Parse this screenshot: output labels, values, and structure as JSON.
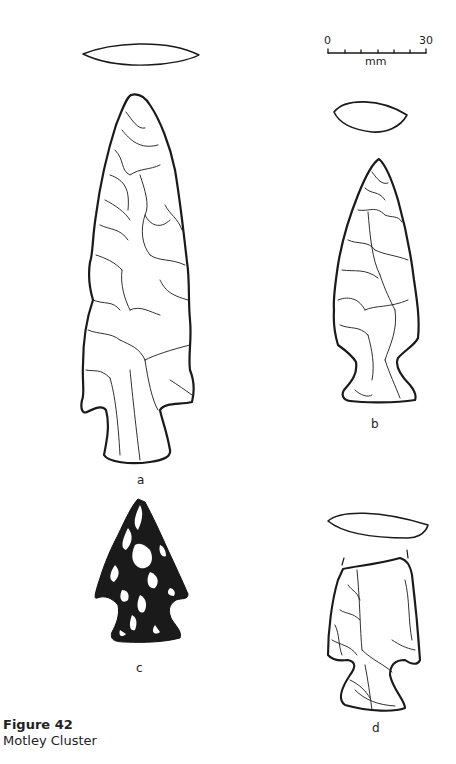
{
  "scale_bar": {
    "start": "0",
    "end": "30",
    "unit": "mm",
    "ticks": 6
  },
  "specimens": [
    {
      "id": "a",
      "label": "a",
      "style": "line drawing with cross-section"
    },
    {
      "id": "b",
      "label": "b",
      "style": "line drawing with cross-section"
    },
    {
      "id": "c",
      "label": "c",
      "style": "stippled shaded drawing"
    },
    {
      "id": "d",
      "label": "d",
      "style": "line drawing with cross-section, broken tip"
    }
  ],
  "caption": {
    "figure": "Figure 42",
    "title": "Motley Cluster"
  },
  "colors": {
    "ink": "#1a1a1a",
    "background": "#ffffff"
  }
}
